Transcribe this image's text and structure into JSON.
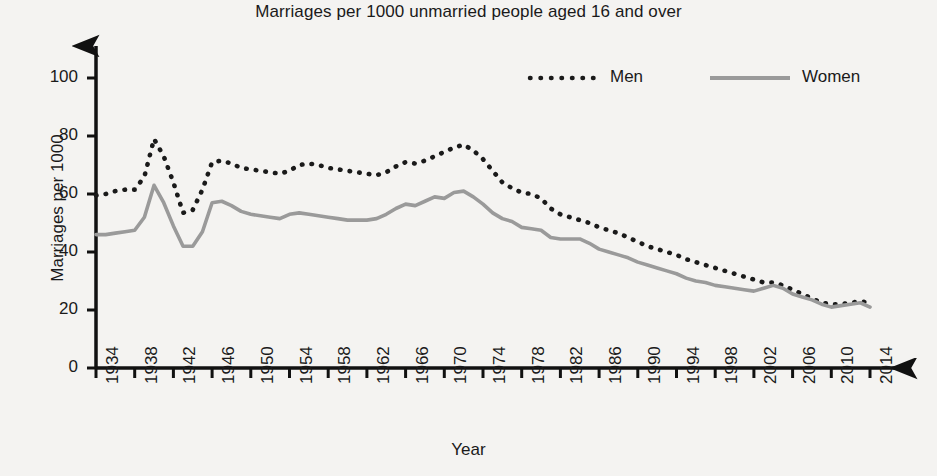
{
  "chart_data": {
    "type": "line",
    "title": "Marriages per 1000 unmarried people aged 16 and over",
    "xlabel": "Year",
    "ylabel": "Marriages per 1000",
    "xlim": [
      1934,
      2014
    ],
    "ylim": [
      0,
      100
    ],
    "grid": false,
    "legend_position": "top-right",
    "xticks": [
      "1934",
      "1938",
      "1942",
      "1946",
      "1950",
      "1954",
      "1958",
      "1962",
      "1966",
      "1970",
      "1974",
      "1978",
      "1982",
      "1986",
      "1990",
      "1994",
      "1998",
      "2002",
      "2006",
      "2010",
      "2014"
    ],
    "yticks": [
      "0",
      "20",
      "40",
      "60",
      "80",
      "100"
    ],
    "x": [
      1934,
      1935,
      1936,
      1937,
      1938,
      1939,
      1940,
      1941,
      1942,
      1943,
      1944,
      1945,
      1946,
      1947,
      1948,
      1949,
      1950,
      1951,
      1952,
      1953,
      1954,
      1955,
      1956,
      1957,
      1958,
      1959,
      1960,
      1961,
      1962,
      1963,
      1964,
      1965,
      1966,
      1967,
      1968,
      1969,
      1970,
      1971,
      1972,
      1973,
      1974,
      1975,
      1976,
      1977,
      1978,
      1979,
      1980,
      1981,
      1982,
      1983,
      1984,
      1985,
      1986,
      1987,
      1988,
      1989,
      1990,
      1991,
      1992,
      1993,
      1994,
      1995,
      1996,
      1997,
      1998,
      1999,
      2000,
      2001,
      2002,
      2003,
      2004,
      2005,
      2006,
      2007,
      2008,
      2009,
      2010,
      2011,
      2012,
      2013,
      2014
    ],
    "series": [
      {
        "name": "Men",
        "style": "dotted",
        "color": "#1a1a1a",
        "values": [
          59.5,
          60.0,
          61.0,
          61.5,
          61.5,
          66.0,
          79.0,
          73.0,
          64.0,
          53.5,
          54.5,
          61.5,
          71.0,
          71.5,
          70.5,
          69.0,
          68.5,
          68.0,
          67.5,
          67.0,
          68.0,
          70.0,
          70.5,
          70.0,
          69.0,
          68.5,
          68.0,
          67.5,
          67.0,
          66.5,
          67.5,
          69.5,
          71.0,
          70.5,
          71.5,
          73.0,
          74.5,
          76.0,
          77.0,
          75.0,
          72.0,
          68.0,
          64.0,
          62.0,
          60.5,
          60.0,
          58.5,
          55.0,
          53.0,
          52.0,
          51.0,
          50.0,
          48.5,
          47.5,
          46.5,
          45.0,
          43.5,
          42.0,
          41.0,
          40.0,
          39.0,
          37.5,
          36.5,
          35.5,
          34.5,
          33.5,
          32.5,
          31.5,
          30.5,
          29.5,
          29.5,
          28.5,
          27.0,
          25.5,
          24.0,
          22.5,
          22.0,
          22.0,
          22.5,
          23.0,
          22.5
        ]
      },
      {
        "name": "Women",
        "style": "solid",
        "color": "#9a9a9a",
        "values": [
          46.0,
          46.0,
          46.5,
          47.0,
          47.5,
          52.0,
          63.0,
          57.0,
          49.0,
          42.0,
          42.0,
          47.0,
          57.0,
          57.5,
          56.0,
          54.0,
          53.0,
          52.5,
          52.0,
          51.5,
          53.0,
          53.5,
          53.0,
          52.5,
          52.0,
          51.5,
          51.0,
          51.0,
          51.0,
          51.5,
          53.0,
          55.0,
          56.5,
          56.0,
          57.5,
          59.0,
          58.5,
          60.5,
          61.0,
          59.0,
          56.5,
          53.5,
          51.5,
          50.5,
          48.5,
          48.0,
          47.5,
          45.0,
          44.5,
          44.5,
          44.5,
          43.0,
          41.0,
          40.0,
          39.0,
          38.0,
          36.5,
          35.5,
          34.5,
          33.5,
          32.5,
          31.0,
          30.0,
          29.5,
          28.5,
          28.0,
          27.5,
          27.0,
          26.5,
          27.5,
          28.5,
          27.5,
          25.5,
          24.5,
          23.5,
          22.0,
          21.0,
          21.5,
          22.0,
          22.5,
          21.0
        ]
      }
    ]
  },
  "legend": {
    "items": [
      {
        "label": "Men"
      },
      {
        "label": "Women"
      }
    ]
  }
}
